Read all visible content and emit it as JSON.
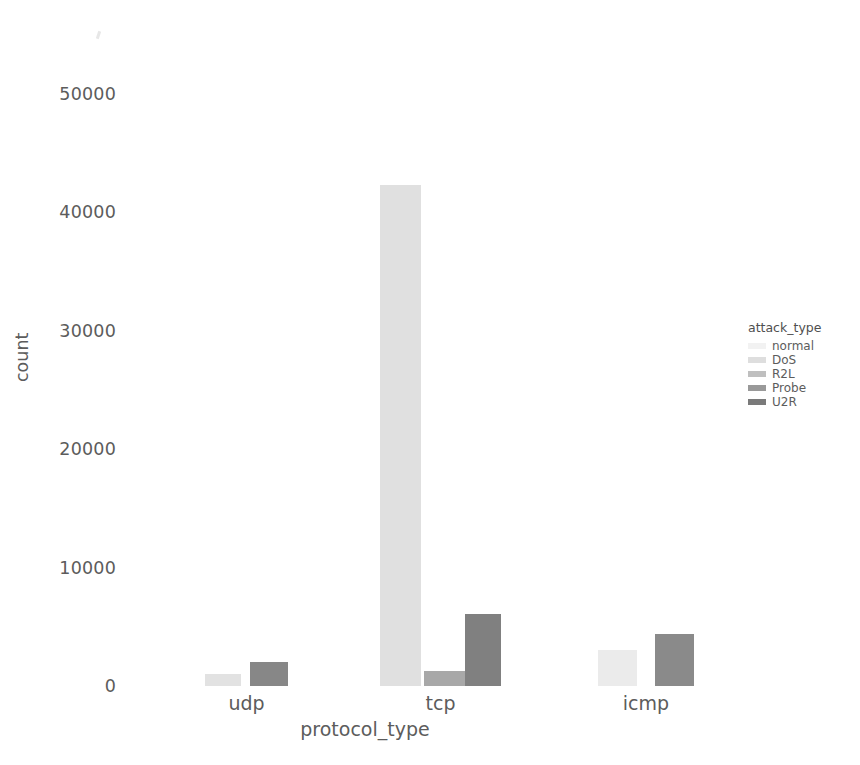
{
  "chart_data": {
    "type": "bar",
    "title": "",
    "xlabel": "protocol_type",
    "ylabel": "count",
    "categories": [
      "udp",
      "tcp",
      "icmp"
    ],
    "ylim": [
      0,
      53000
    ],
    "yticks": [
      0,
      10000,
      20000,
      30000,
      40000,
      50000
    ],
    "ytick_labels": [
      "0",
      "10000",
      "20000",
      "30000",
      "40000",
      "50000"
    ],
    "grid": false,
    "legend_position": "right",
    "legend_title": "attack_type",
    "series": [
      {
        "name": "normal",
        "color": "#f0f0f0",
        "values": [
          0,
          0,
          3000
        ]
      },
      {
        "name": "DoS",
        "color": "#dcdcdc",
        "values": [
          1000,
          42300,
          0
        ]
      },
      {
        "name": "R2L",
        "color": "#bdbdbd",
        "values": [
          0,
          1300,
          0
        ]
      },
      {
        "name": "Probe",
        "color": "#9a9a9a",
        "values": [
          0,
          0,
          0
        ]
      },
      {
        "name": "U2R",
        "color": "#7d7d7d",
        "values": [
          2000,
          6100,
          4400
        ]
      }
    ],
    "bars": [
      {
        "category": "udp",
        "series": "DoS",
        "value": 1000,
        "x": 205,
        "width": 36,
        "color": "#e2e2e2"
      },
      {
        "category": "udp",
        "series": "U2R",
        "value": 2000,
        "x": 250,
        "width": 38,
        "color": "#878787"
      },
      {
        "category": "tcp",
        "series": "DoS",
        "value": 42300,
        "x": 380,
        "width": 41,
        "color": "#e0e0e0"
      },
      {
        "category": "tcp",
        "series": "R2L",
        "value": 1300,
        "x": 424,
        "width": 41,
        "color": "#a8a8a8"
      },
      {
        "category": "tcp",
        "series": "U2R",
        "value": 6100,
        "x": 465,
        "width": 36,
        "color": "#808080"
      },
      {
        "category": "icmp",
        "series": "normal",
        "value": 3000,
        "x": 598,
        "width": 39,
        "color": "#ebebeb"
      },
      {
        "category": "icmp",
        "series": "U2R",
        "value": 4400,
        "x": 655,
        "width": 39,
        "color": "#8a8a8a"
      }
    ]
  },
  "axis": {
    "y_label": "count",
    "x_label": "protocol_type",
    "y_ticks": [
      "50000",
      "40000",
      "30000",
      "20000",
      "10000",
      "0"
    ],
    "x_ticks": [
      "udp",
      "tcp",
      "icmp"
    ]
  },
  "legend": {
    "title": "attack_type",
    "items": [
      {
        "label": "normal",
        "color": "#f2f2f2"
      },
      {
        "label": "DoS",
        "color": "#dedede"
      },
      {
        "label": "R2L",
        "color": "#bfbfbf"
      },
      {
        "label": "Probe",
        "color": "#999999"
      },
      {
        "label": "U2R",
        "color": "#7a7a7a"
      }
    ]
  }
}
